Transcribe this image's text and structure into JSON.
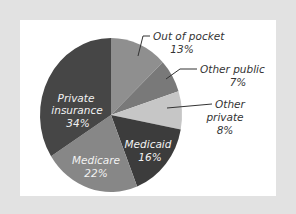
{
  "chart_data": {
    "type": "pie",
    "title": "",
    "start_angle": "12 o'clock",
    "direction": "clockwise",
    "slices": [
      {
        "label": "Out of pocket",
        "value": 13,
        "display": "13%",
        "color": "#8f8f8f",
        "label_position": "outside"
      },
      {
        "label": "Other public",
        "value": 7,
        "display": "7%",
        "color": "#797979",
        "label_position": "outside"
      },
      {
        "label": "Other private",
        "value": 8,
        "display": "8%",
        "color": "#c6c6c6",
        "label_position": "outside"
      },
      {
        "label": "Medicaid",
        "value": 16,
        "display": "16%",
        "color": "#3c3c3c",
        "label_position": "inside"
      },
      {
        "label": "Medicare",
        "value": 22,
        "display": "22%",
        "color": "#878787",
        "label_position": "inside"
      },
      {
        "label": "Private insurance",
        "value": 34,
        "display": "34%",
        "color": "#464646",
        "label_position": "inside"
      }
    ],
    "categories": [
      "Out of pocket",
      "Other public",
      "Other private",
      "Medicaid",
      "Medicare",
      "Private insurance"
    ],
    "values": [
      13,
      7,
      8,
      16,
      22,
      34
    ],
    "legend": "none (direct labels)"
  },
  "labels": {
    "out_of_pocket": {
      "name": "Out of pocket",
      "pct": "13%"
    },
    "other_public": {
      "name": "Other public",
      "pct": "7%"
    },
    "other_private": {
      "line1": "Other",
      "line2": "private",
      "pct": "8%"
    },
    "medicaid": {
      "name": "Medicaid",
      "pct": "16%"
    },
    "medicare": {
      "name": "Medicare",
      "pct": "22%"
    },
    "private_insurance": {
      "line1": "Private",
      "line2": "insurance",
      "pct": "34%"
    }
  }
}
